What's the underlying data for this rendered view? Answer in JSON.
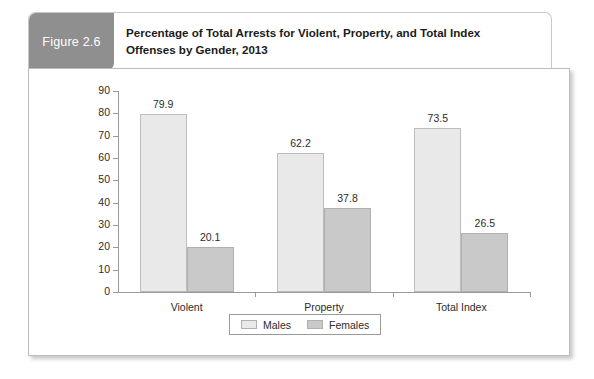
{
  "figure": {
    "badge_label": "Figure 2.6",
    "title_line1": "Percentage of Total Arrests for Violent, Property, and Total Index",
    "title_line2": "Offenses by Gender, 2013"
  },
  "colors": {
    "badge_background": "#8f8f8f",
    "badge_text": "#ffffff",
    "males_fill": "#e9e9e9",
    "females_fill": "#c9c9c9",
    "axis": "#9a9a9a",
    "text": "#2b2b2b"
  },
  "chart_data": {
    "type": "bar",
    "title": "Percentage of Total Arrests for Violent, Property, and Total Index Offenses by Gender, 2013",
    "xlabel": "",
    "ylabel": "",
    "categories": [
      "Violent",
      "Property",
      "Total Index"
    ],
    "series": [
      {
        "name": "Males",
        "values": [
          79.9,
          62.2,
          73.5
        ]
      },
      {
        "name": "Females",
        "values": [
          20.1,
          37.8,
          26.5
        ]
      }
    ],
    "ylim": [
      0,
      90
    ],
    "yticks": [
      0,
      10,
      20,
      30,
      40,
      50,
      60,
      70,
      80,
      90
    ],
    "ytick_labels": [
      "0",
      "10",
      "20",
      "30",
      "40",
      "50",
      "60",
      "70",
      "80",
      "90"
    ],
    "data_labels": [
      "79.9",
      "20.1",
      "62.2",
      "37.8",
      "73.5",
      "26.5"
    ],
    "grid": false,
    "legend_position": "bottom"
  }
}
